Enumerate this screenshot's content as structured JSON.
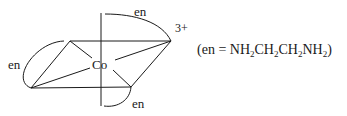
{
  "diagram": {
    "type": "octahedral-complex",
    "metal": "Co",
    "charge": "3+",
    "ligands": [
      {
        "label": "en",
        "position": "top"
      },
      {
        "label": "en",
        "position": "left"
      },
      {
        "label": "en",
        "position": "bottom"
      }
    ],
    "definition": {
      "open": "(",
      "ligand": "en",
      "equals": " = ",
      "formula_parts": [
        {
          "text": "NH",
          "sub": "2"
        },
        {
          "text": "CH",
          "sub": "2"
        },
        {
          "text": "CH",
          "sub": "2"
        },
        {
          "text": "NH",
          "sub": "2"
        }
      ],
      "close": ")"
    },
    "colors": {
      "ink": "#1a1a1a",
      "background": "#ffffff"
    }
  }
}
